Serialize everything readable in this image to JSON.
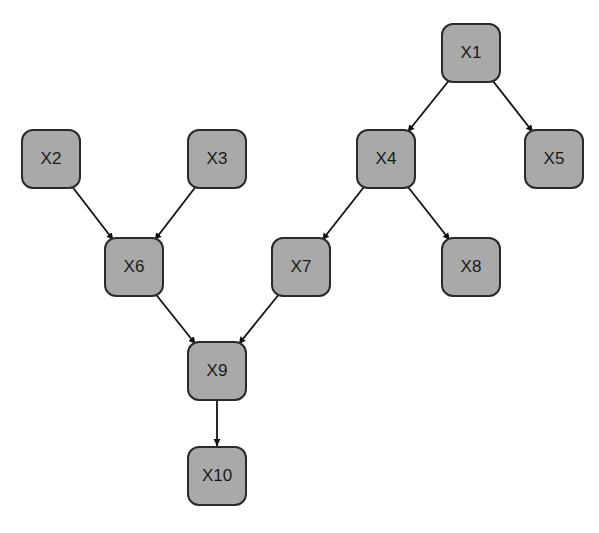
{
  "diagram": {
    "type": "directed-graph",
    "node_fill": "#a9a9a9",
    "node_border": "#2a2a2a",
    "nodes": [
      {
        "id": "X1",
        "label": "X1",
        "x": 441,
        "y": 23
      },
      {
        "id": "X2",
        "label": "X2",
        "x": 21,
        "y": 129
      },
      {
        "id": "X3",
        "label": "X3",
        "x": 187,
        "y": 129
      },
      {
        "id": "X4",
        "label": "X4",
        "x": 356,
        "y": 129
      },
      {
        "id": "X5",
        "label": "X5",
        "x": 524,
        "y": 129
      },
      {
        "id": "X6",
        "label": "X6",
        "x": 104,
        "y": 237
      },
      {
        "id": "X7",
        "label": "X7",
        "x": 271,
        "y": 237
      },
      {
        "id": "X8",
        "label": "X8",
        "x": 441,
        "y": 237
      },
      {
        "id": "X9",
        "label": "X9",
        "x": 187,
        "y": 341
      },
      {
        "id": "X10",
        "label": "X10",
        "x": 187,
        "y": 446
      }
    ],
    "edges": [
      {
        "from": "X1",
        "to": "X4"
      },
      {
        "from": "X1",
        "to": "X5"
      },
      {
        "from": "X2",
        "to": "X6"
      },
      {
        "from": "X3",
        "to": "X6"
      },
      {
        "from": "X4",
        "to": "X7"
      },
      {
        "from": "X4",
        "to": "X8"
      },
      {
        "from": "X6",
        "to": "X9"
      },
      {
        "from": "X7",
        "to": "X9"
      },
      {
        "from": "X9",
        "to": "X10"
      }
    ]
  }
}
